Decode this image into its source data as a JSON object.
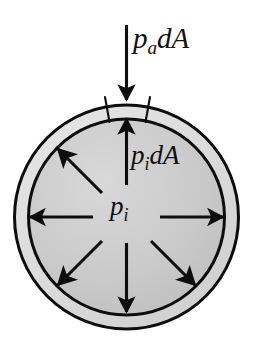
{
  "figure": {
    "background_color": "#ffffff",
    "width": 259,
    "height": 360
  },
  "labels": {
    "external_pressure_force": {
      "text": "p_a dA",
      "base": "p",
      "subscript": "a",
      "suffix": "dA",
      "meaning": "ambient-pressure force on area element"
    },
    "internal_pressure_force": {
      "text": "p_i dA",
      "base": "p",
      "subscript": "i",
      "suffix": "dA",
      "meaning": "internal-pressure force on area element"
    },
    "internal_pressure": {
      "text": "p_i",
      "base": "p",
      "subscript": "i",
      "suffix": "",
      "meaning": "internal pressure"
    }
  },
  "shapes": {
    "outer_circle": {
      "name": "outer-circle",
      "cx": 126.5,
      "cy": 217,
      "r": 113,
      "stroke": "#0d0d0d",
      "stroke_width": 3,
      "fill": "#dcdcdc"
    },
    "inner_circle": {
      "name": "inner-circle",
      "cx": 126.5,
      "cy": 217,
      "r": 99,
      "stroke": "#0d0d0d",
      "stroke_width": 3,
      "fill": "#c9c9c9"
    },
    "ring_thickness": 14
  },
  "colors": {
    "outline": "#0d0d0d",
    "arrow": "#0d0d0d",
    "ring_fill": "#dcdcdc",
    "disc_fill": "#c9c9c9",
    "disc_fill_light": "#d6d6d6",
    "disc_fill_dark": "#bcbcbc",
    "background": "#ffffff"
  },
  "arrows": {
    "external": [
      {
        "name": "ambient-pressure-arrow",
        "direction": "down",
        "angle_deg": 270,
        "x1": 126.5,
        "y1": 25,
        "x2": 126.5,
        "y2": 101,
        "points_toward": "surface",
        "label": "p_a dA"
      }
    ],
    "internal": [
      {
        "name": "internal-arrow-up",
        "direction": "up",
        "angle_deg": 90,
        "label": "p_i dA"
      },
      {
        "name": "internal-arrow-upper-left",
        "direction": "upper-left",
        "angle_deg": 135,
        "label": ""
      },
      {
        "name": "internal-arrow-left",
        "direction": "left",
        "angle_deg": 180,
        "label": ""
      },
      {
        "name": "internal-arrow-lower-left",
        "direction": "lower-left",
        "angle_deg": 225,
        "label": ""
      },
      {
        "name": "internal-arrow-down",
        "direction": "down",
        "angle_deg": 270,
        "label": ""
      },
      {
        "name": "internal-arrow-lower-right",
        "direction": "lower-right",
        "angle_deg": 315,
        "label": ""
      },
      {
        "name": "internal-arrow-right",
        "direction": "right",
        "angle_deg": 0,
        "label": ""
      }
    ],
    "internal_count": 7,
    "origin": {
      "cx": 126.5,
      "cy": 217
    }
  },
  "tick_marks": {
    "name": "area-element-ticks",
    "count": 2,
    "meaning": "delimit the differential area element dA at the top of the shell",
    "left": {
      "x1": 104,
      "y1": 97,
      "x2": 108,
      "y2": 120
    },
    "right": {
      "x1": 149,
      "y1": 97,
      "x2": 145,
      "y2": 120
    }
  }
}
